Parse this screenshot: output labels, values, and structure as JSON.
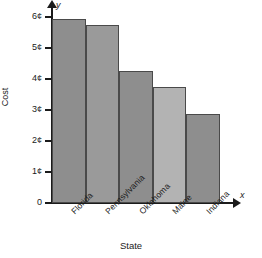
{
  "chart_data": {
    "type": "bar",
    "title": "",
    "categories": [
      "Florida",
      "Pennsylvania",
      "Oklahoma",
      "Maine",
      "Indiana"
    ],
    "values": [
      6.0,
      5.8,
      4.3,
      3.8,
      2.9
    ],
    "value_unit": "¢",
    "xlabel": "State",
    "ylabel": "Cost",
    "ylim": [
      0,
      6.3
    ],
    "yticks": [
      0,
      1,
      2,
      3,
      4,
      5,
      6
    ],
    "ytick_labels": [
      "0",
      "1¢",
      "2¢",
      "3¢",
      "4¢",
      "5¢",
      "6¢"
    ],
    "grid": false,
    "legend": null,
    "axis_variables": {
      "x": "x",
      "y": "y"
    },
    "bar_colors": [
      "#8e8e8e",
      "#9a9a9a",
      "#8e8e8e",
      "#b3b3b3",
      "#8e8e8e"
    ],
    "bar_edge_color": "#4a4a4a",
    "axis_color": "#1b1b1b"
  }
}
